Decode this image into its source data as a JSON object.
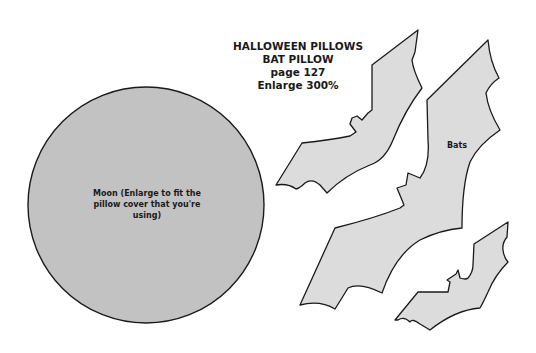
{
  "title_block": {
    "line1": "HALLOWEEN PILLOWS",
    "line2": "BAT PILLOW",
    "line3": "page 127",
    "line4": "Enlarge 300%"
  },
  "moon": {
    "label": "Moon (Enlarge to fit the pillow cover that you're using)",
    "fill": "#c2c2c2",
    "stroke": "#1a1a1a"
  },
  "bats": {
    "label": "Bats",
    "fill": "#dcdcdc",
    "stroke": "#1a1a1a",
    "count": 3
  }
}
